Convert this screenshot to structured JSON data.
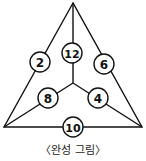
{
  "diagram": {
    "type": "triangle-number-puzzle",
    "line_color": "#111111",
    "vertices": {
      "top": [
        73,
        3
      ],
      "bottom_left": [
        4,
        127
      ],
      "bottom_right": [
        142,
        127
      ],
      "center": [
        73,
        83
      ]
    },
    "nodes": [
      {
        "id": "left-edge",
        "label": "2",
        "x": 40,
        "y": 62
      },
      {
        "id": "center-top-spoke",
        "label": "12",
        "x": 72,
        "y": 53
      },
      {
        "id": "right-edge",
        "label": "6",
        "x": 104,
        "y": 64
      },
      {
        "id": "center-left-spoke",
        "label": "8",
        "x": 48,
        "y": 98
      },
      {
        "id": "center-right-spoke",
        "label": "4",
        "x": 98,
        "y": 98
      },
      {
        "id": "bottom-edge",
        "label": "10",
        "x": 73,
        "y": 127
      }
    ]
  },
  "caption": "〈완성 그림〉"
}
